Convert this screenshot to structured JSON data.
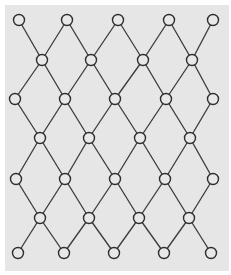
{
  "diagram": {
    "type": "lattice-graph",
    "colors": {
      "background": "#e6e6e6",
      "margin": "#ffffff",
      "edge": "#3a3a3a",
      "node_stroke": "#2e2e2e",
      "node_fill": "#e8e8e8"
    },
    "panel": {
      "x": 5,
      "y": 5,
      "width": 224,
      "height": 266
    },
    "node_radius": 5.5,
    "rows": [
      {
        "y": 20,
        "xs": [
          19,
          67,
          118,
          169,
          213
        ]
      },
      {
        "y": 60,
        "xs": [
          42,
          91,
          143,
          192
        ]
      },
      {
        "y": 99,
        "xs": [
          15,
          65,
          115,
          166,
          213
        ]
      },
      {
        "y": 138,
        "xs": [
          40,
          89,
          140,
          190
        ]
      },
      {
        "y": 179,
        "xs": [
          16,
          65,
          115,
          165,
          213
        ]
      },
      {
        "y": 218,
        "xs": [
          40,
          89,
          139,
          189
        ]
      },
      {
        "y": 253,
        "xs": [
          18,
          64,
          114,
          164,
          211
        ]
      }
    ]
  }
}
